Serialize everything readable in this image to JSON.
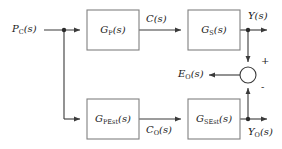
{
  "diagram": {
    "type": "control-block-diagram",
    "colors": {
      "line": "#3a3a3a",
      "block_border": "#808080",
      "block_fill": "#ffffff",
      "text": "#1a1a1a",
      "background": "#ffffff"
    },
    "blocks": [
      {
        "id": "gp",
        "base": "G",
        "subscript": "P",
        "arg": "(s)",
        "label": "G_P(s)",
        "x": 87,
        "y": 10,
        "w": 52,
        "h": 40
      },
      {
        "id": "gs",
        "base": "G",
        "subscript": "S",
        "arg": "(s)",
        "label": "G_S(s)",
        "x": 188,
        "y": 10,
        "w": 52,
        "h": 40
      },
      {
        "id": "gpest",
        "base": "G",
        "subscript": "PEst",
        "arg": "(s)",
        "label": "G_PEst(s)",
        "x": 87,
        "y": 99,
        "w": 52,
        "h": 40
      },
      {
        "id": "gsest",
        "base": "G",
        "subscript": "SEst",
        "arg": "(s)",
        "label": "G_SEst(s)",
        "x": 188,
        "y": 99,
        "w": 52,
        "h": 40
      }
    ],
    "signals": [
      {
        "id": "pc",
        "base": "P",
        "subscript": "C",
        "arg": "(s)",
        "label": "P_C(s)",
        "x": 12,
        "y": 24
      },
      {
        "id": "c",
        "base": "C",
        "subscript": "",
        "arg": "(s)",
        "label": "C(s)",
        "x": 146,
        "y": 14
      },
      {
        "id": "y",
        "base": "Y",
        "subscript": "",
        "arg": "(s)",
        "label": "Y(s)",
        "x": 248,
        "y": 11
      },
      {
        "id": "eo",
        "base": "E",
        "subscript": "O",
        "arg": "(s)",
        "label": "E_O(s)",
        "x": 178,
        "y": 66
      },
      {
        "id": "co",
        "base": "C",
        "subscript": "O",
        "arg": "(s)",
        "label": "C_O(s)",
        "x": 146,
        "y": 125
      },
      {
        "id": "yo",
        "base": "Y",
        "subscript": "O",
        "arg": "(s)",
        "label": "Y_O(s)",
        "x": 248,
        "y": 127
      }
    ],
    "summing_junction": {
      "id": "sum",
      "cx": 248,
      "cy": 75,
      "r": 8,
      "inputs": [
        {
          "from": "y",
          "sign": "+",
          "direction": "from-top",
          "sign_x": 261,
          "sign_y": 57
        },
        {
          "from": "yo",
          "sign": "-",
          "direction": "from-bottom",
          "sign_x": 261,
          "sign_y": 85
        }
      ],
      "output": {
        "to": "eo",
        "direction": "to-left"
      }
    },
    "branch_points": [
      {
        "id": "input-branch",
        "x": 64,
        "y": 30
      },
      {
        "id": "output-branch",
        "x": 248,
        "y": 30
      },
      {
        "id": "lower-branch",
        "x": 248,
        "y": 119
      }
    ]
  }
}
